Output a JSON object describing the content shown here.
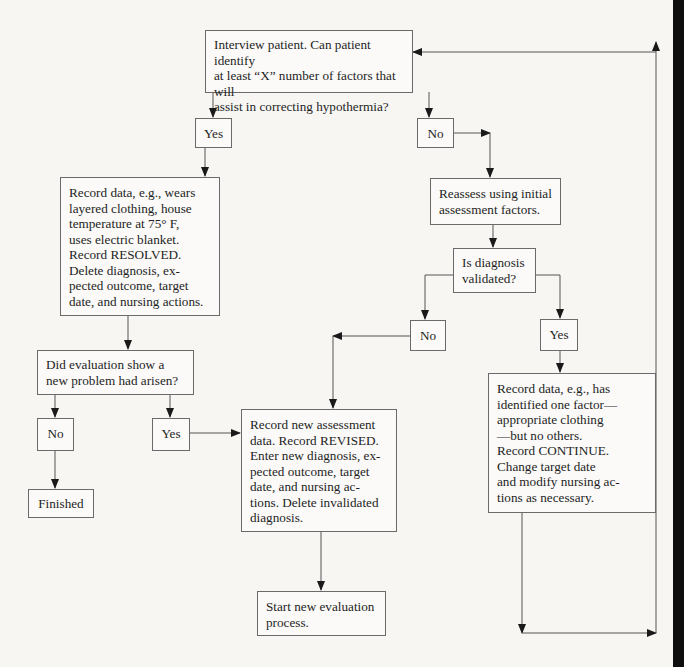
{
  "flowchart": {
    "start_question": "Interview patient. Can patient identify\nat least “X” number of factors that will\nassist in correcting hypothermia?",
    "answer_yes_1": "Yes",
    "answer_no_1": "No",
    "resolved_action": "Record data, e.g., wears\nlayered clothing, house\ntemperature at 75° F,\nuses electric blanket.\nRecord RESOLVED.\nDelete diagnosis, ex-\npected outcome, target\ndate, and nursing actions.",
    "reassess_action": "Reassess using initial\nassessment factors.",
    "validated_question": "Is diagnosis\nvalidated?",
    "answer_no_2": "No",
    "answer_yes_2": "Yes",
    "new_problem_question": "Did evaluation show a\nnew problem had arisen?",
    "answer_no_3": "No",
    "answer_yes_3": "Yes",
    "finished": "Finished",
    "revised_action": "Record new assessment\ndata. Record REVISED.\nEnter new diagnosis, ex-\npected outcome, target\ndate, and nursing ac-\ntions. Delete invalidated\ndiagnosis.",
    "start_new_action": "Start new evaluation\nprocess.",
    "continue_action": "Record data, e.g., has\nidentified one factor—\nappropriate clothing\n—but no others.\nRecord CONTINUE.\nChange target date\nand modify nursing ac-\ntions as necessary."
  },
  "colors": {
    "background": "#f7f6f3",
    "line": "#555555",
    "box_border": "#6a6a6a",
    "text": "#1e1e1e"
  }
}
